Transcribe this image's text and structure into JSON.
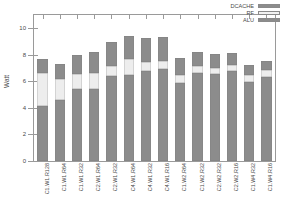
{
  "chart_data": {
    "type": "bar",
    "subtype": "stacked-vertical",
    "title": "",
    "xlabel": "",
    "ylabel": "Watt",
    "ylim": [
      0,
      11
    ],
    "yticks": [
      0,
      2,
      4,
      6,
      8,
      10
    ],
    "ytick_labels": [
      "0",
      "2",
      "4",
      "6",
      "8",
      "10"
    ],
    "grid": false,
    "legend_position": "top-right",
    "categories": [
      "C1.W1.R128",
      "C1.W1.R64",
      "C1.W1.R32",
      "C2.W1.R64",
      "C2.W1.R32",
      "C4.W1.R64",
      "C4.W1.R32",
      "C4.W1.R16",
      "C1.W2.R64",
      "C1.W2.R32",
      "C2.W2.R32",
      "C2.W2.R16",
      "C1.W4.R32",
      "C1.W4.R16"
    ],
    "series": [
      {
        "name": "ALU",
        "color": "#8c8c8c",
        "values": [
          4.15,
          4.6,
          5.4,
          5.45,
          6.4,
          6.5,
          6.8,
          6.95,
          5.85,
          6.65,
          6.55,
          6.8,
          5.95,
          6.35
        ]
      },
      {
        "name": "RF",
        "color": "#ededed",
        "values": [
          2.45,
          1.6,
          1.15,
          1.2,
          0.75,
          1.15,
          0.65,
          0.55,
          0.6,
          0.5,
          0.45,
          0.4,
          0.55,
          0.5
        ]
      },
      {
        "name": "DCACHE",
        "color": "#8c8c8c",
        "values": [
          1.1,
          1.1,
          1.45,
          1.6,
          1.8,
          1.75,
          1.85,
          1.85,
          1.3,
          1.1,
          1.05,
          0.95,
          0.75,
          0.7
        ]
      }
    ],
    "totals": [
      7.7,
      7.3,
      8.0,
      8.25,
      8.95,
      9.4,
      9.3,
      9.35,
      7.75,
      8.25,
      8.05,
      8.15,
      7.25,
      7.55
    ]
  },
  "legend": {
    "entries": [
      {
        "label": "DCACHE",
        "swatch": "dcache"
      },
      {
        "label": "RF",
        "swatch": "rf"
      },
      {
        "label": "ALU",
        "swatch": "alu"
      }
    ]
  },
  "axes": {
    "y_title": "Watt"
  }
}
